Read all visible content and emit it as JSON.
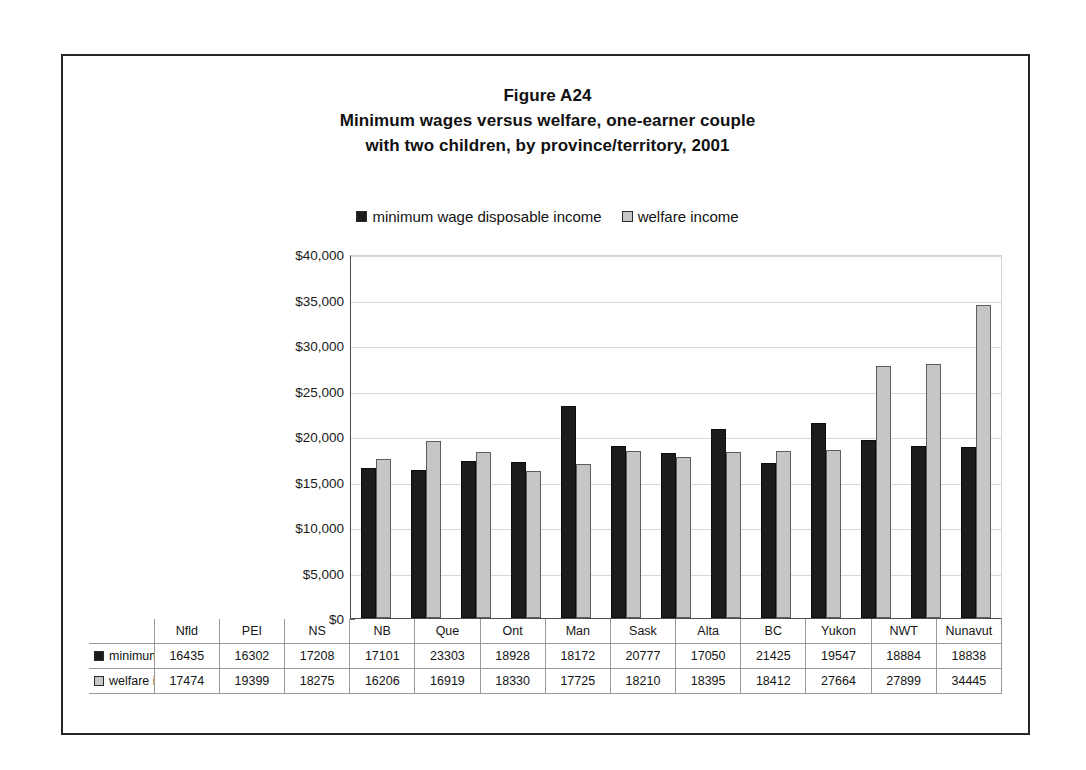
{
  "figure": {
    "title_lines": [
      "Figure A24",
      "Minimum wages versus welfare, one-earner couple",
      "with two children, by province/territory, 2001"
    ]
  },
  "legend": {
    "entries": [
      {
        "label": "minimum wage disposable income",
        "swatch": "dark-square-icon",
        "color": "#1c1c1c"
      },
      {
        "label": "welfare income",
        "swatch": "light-square-icon",
        "color": "#c6c6c6"
      }
    ]
  },
  "chart_data": {
    "type": "bar",
    "xlabel": "",
    "ylabel": "",
    "ylim": [
      0,
      40000
    ],
    "ytick_labels": [
      "$0",
      "$5,000",
      "$10,000",
      "$15,000",
      "$20,000",
      "$25,000",
      "$30,000",
      "$35,000",
      "$40,000"
    ],
    "ytick_values": [
      0,
      5000,
      10000,
      15000,
      20000,
      25000,
      30000,
      35000,
      40000
    ],
    "grid": true,
    "legend_position": "top-center",
    "categories": [
      "Nfld",
      "PEI",
      "NS",
      "NB",
      "Que",
      "Ont",
      "Man",
      "Sask",
      "Alta",
      "BC",
      "Yukon",
      "NWT",
      "Nunavut"
    ],
    "series": [
      {
        "name": "minimum wage disposable income",
        "color": "#1c1c1c",
        "values": [
          16435,
          16302,
          17208,
          17101,
          23303,
          18928,
          18172,
          20777,
          17050,
          21425,
          19547,
          18884,
          18838
        ]
      },
      {
        "name": "welfare income",
        "color": "#c6c6c6",
        "values": [
          17474,
          19399,
          18275,
          16206,
          16919,
          18330,
          17725,
          18210,
          18395,
          18412,
          27664,
          27899,
          34445
        ]
      }
    ]
  }
}
